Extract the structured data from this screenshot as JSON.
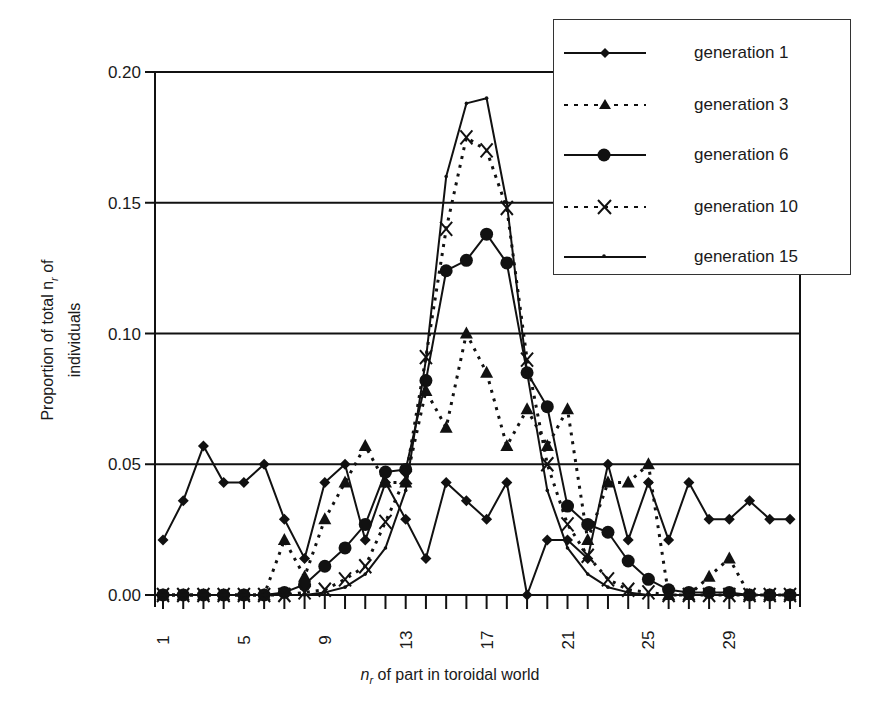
{
  "chart_data": {
    "type": "line",
    "title": "",
    "xlabel": "n_r of part in toroidal world",
    "ylabel": "Proportion of total n_r of individuals",
    "x": [
      1,
      2,
      3,
      4,
      5,
      6,
      7,
      8,
      9,
      10,
      11,
      12,
      13,
      14,
      15,
      16,
      17,
      18,
      19,
      20,
      21,
      22,
      23,
      24,
      25,
      26,
      27,
      28,
      29,
      30,
      31,
      32
    ],
    "x_tick_labels": [
      "1",
      "5",
      "9",
      "13",
      "17",
      "21",
      "25",
      "29"
    ],
    "x_tick_values": [
      1,
      5,
      9,
      13,
      17,
      21,
      25,
      29
    ],
    "y_tick_labels": [
      "0.00",
      "0.05",
      "0.10",
      "0.15",
      "0.20"
    ],
    "ylim": [
      0,
      0.2
    ],
    "xlim": [
      1,
      32
    ],
    "grid": "horizontal",
    "legend_position": "top-right",
    "series": [
      {
        "name": "generation 1",
        "marker": "diamond",
        "line": "solid",
        "values": [
          0.021,
          0.036,
          0.057,
          0.043,
          0.043,
          0.05,
          0.029,
          0.014,
          0.043,
          0.05,
          0.021,
          0.043,
          0.029,
          0.014,
          0.043,
          0.036,
          0.029,
          0.043,
          0.0,
          0.021,
          0.021,
          0.014,
          0.05,
          0.021,
          0.043,
          0.021,
          0.043,
          0.029,
          0.029,
          0.036,
          0.029,
          0.029
        ]
      },
      {
        "name": "generation 3",
        "marker": "triangle",
        "line": "dotted",
        "values": [
          0,
          0,
          0,
          0,
          0,
          0,
          0.021,
          0.007,
          0.029,
          0.043,
          0.057,
          0.043,
          0.043,
          0.078,
          0.064,
          0.1,
          0.085,
          0.057,
          0.071,
          0.057,
          0.071,
          0.021,
          0.043,
          0.043,
          0.05,
          0.0,
          0.0,
          0.007,
          0.014,
          0.0,
          0.0,
          0.0
        ]
      },
      {
        "name": "generation 6",
        "marker": "circle",
        "line": "solid",
        "values": [
          0,
          0,
          0,
          0,
          0,
          0,
          0.001,
          0.004,
          0.011,
          0.018,
          0.027,
          0.047,
          0.048,
          0.082,
          0.124,
          0.128,
          0.138,
          0.127,
          0.085,
          0.072,
          0.034,
          0.027,
          0.024,
          0.013,
          0.006,
          0.002,
          0.001,
          0.001,
          0.001,
          0.0,
          0.0,
          0.0
        ]
      },
      {
        "name": "generation 10",
        "marker": "x",
        "line": "dotted",
        "values": [
          0,
          0,
          0,
          0,
          0,
          0,
          0,
          0.001,
          0.002,
          0.006,
          0.011,
          0.028,
          0.045,
          0.091,
          0.14,
          0.175,
          0.17,
          0.148,
          0.09,
          0.05,
          0.027,
          0.015,
          0.006,
          0.002,
          0.001,
          0.0,
          0.0,
          0.0,
          0.0,
          0.0,
          0.0,
          0.0
        ]
      },
      {
        "name": "generation 15",
        "marker": "dot",
        "line": "solid",
        "values": [
          0,
          0,
          0,
          0,
          0,
          0,
          0,
          0,
          0.001,
          0.003,
          0.008,
          0.018,
          0.04,
          0.09,
          0.16,
          0.188,
          0.19,
          0.15,
          0.085,
          0.04,
          0.018,
          0.008,
          0.003,
          0.001,
          0,
          0,
          0,
          0,
          0,
          0,
          0,
          0
        ]
      }
    ]
  },
  "legend": {
    "items": [
      {
        "label": "generation 1"
      },
      {
        "label": "generation 3"
      },
      {
        "label": "generation 6"
      },
      {
        "label": "generation 10"
      },
      {
        "label": "generation 15"
      }
    ]
  },
  "axes": {
    "ylabel_line1": "Proportion of total n",
    "ylabel_sub": "r",
    "ylabel_line1_tail": " of",
    "ylabel_line2": "individuals",
    "xlabel_var": "n",
    "xlabel_sub": "r",
    "xlabel_rest": " of part in toroidal world"
  }
}
